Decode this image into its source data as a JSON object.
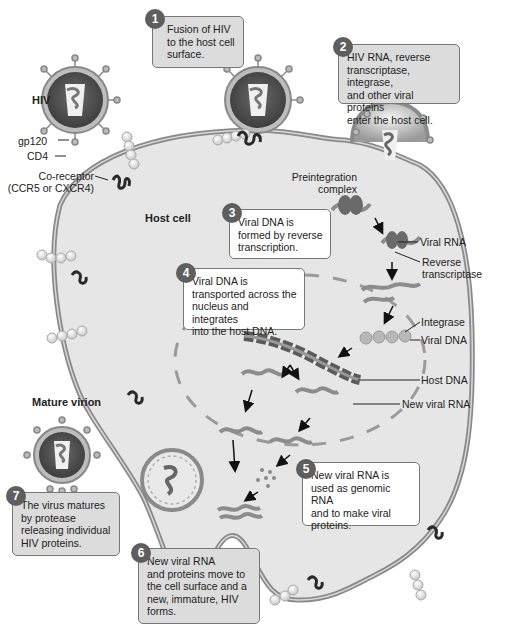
{
  "diagram": {
    "colors": {
      "cell_fill": "#e6e6e6",
      "membrane": "#8a8a8a",
      "virion_dark": "#4a4a4a",
      "box_gray": "#dcdcdc",
      "box_white": "#ffffff",
      "badge": "#5e5e5e",
      "rna": "#8c8c8c",
      "coreceptor": "#2a2a2a"
    },
    "labels": {
      "hiv": "HIV",
      "gp120": "gp120",
      "cd4": "CD4",
      "coreceptor_line1": "Co-receptor",
      "coreceptor_line2": "(CCR5 or CXCR4)",
      "host_cell": "Host cell",
      "preintegration_line1": "Preintegration",
      "preintegration_line2": "complex",
      "viral_rna": "Viral RNA",
      "reverse_transcriptase_line1": "Reverse",
      "reverse_transcriptase_line2": "transcriptase",
      "integrase": "Integrase",
      "viral_dna": "Viral DNA",
      "host_dna": "Host DNA",
      "new_viral_rna": "New viral RNA",
      "mature_virion": "Mature virion"
    },
    "steps": [
      {
        "number": "1",
        "text": "Fusion of HIV\nto the host cell\nsurface."
      },
      {
        "number": "2",
        "text": "HIV RNA, reverse\ntranscriptase, integrase,\nand other viral proteins\nenter the host cell."
      },
      {
        "number": "3",
        "text": "Viral DNA is\nformed by reverse\ntranscription."
      },
      {
        "number": "4",
        "text": "Viral DNA is\ntransported across the\nnucleus and integrates\ninto the host DNA."
      },
      {
        "number": "5",
        "text": "New viral RNA is\nused as genomic RNA\nand to make viral\nproteins."
      },
      {
        "number": "6",
        "text": "New viral RNA\nand proteins move to\nthe cell surface and a\nnew, immature, HIV\nforms."
      },
      {
        "number": "7",
        "text": "The virus matures\nby protease\nreleasing individual\nHIV proteins."
      }
    ]
  }
}
